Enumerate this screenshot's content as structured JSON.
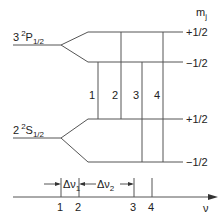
{
  "diagram": {
    "axis_title": "m",
    "axis_title_sub": "j",
    "upper_level": {
      "n": "3",
      "sup": "2",
      "letter": "P",
      "sub": "1/2"
    },
    "lower_level": {
      "n": "2",
      "sup": "2",
      "letter": "S",
      "sub": "1/2"
    },
    "mj_labels": [
      "+1/2",
      "−1/2",
      "+1/2",
      "−1/2"
    ],
    "transitions": [
      "1",
      "2",
      "3",
      "4"
    ],
    "spectrum": {
      "ticks": [
        "1",
        "2",
        "3",
        "4"
      ],
      "delta1": "Δν",
      "delta1_sub": "1",
      "delta2": "Δν",
      "delta2_sub": "2",
      "axis_label": "ν"
    }
  }
}
